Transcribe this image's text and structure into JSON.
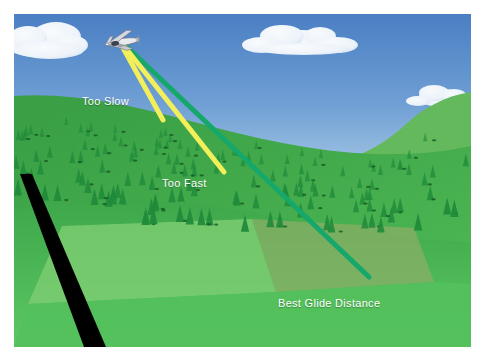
{
  "diagram": {
    "title": "Best Glide Distance",
    "frame": {
      "background_color": "#ffffff",
      "margin_px": 14,
      "scene_width": 457,
      "scene_height": 333
    },
    "sky": {
      "name": "sky",
      "color_top": "#4e82c4",
      "color_bottom": "#b9d4ea",
      "clouds": [
        {
          "name": "cloud-top-left",
          "x": 2,
          "y": 6,
          "w": 70,
          "h": 34
        },
        {
          "name": "cloud-upper-center",
          "x": 238,
          "y": 14,
          "w": 112,
          "h": 34
        },
        {
          "name": "cloud-right-small",
          "x": 398,
          "y": 72,
          "w": 56,
          "h": 20
        }
      ]
    },
    "terrain": {
      "name": "forested-hillside",
      "ridge_color": "#2f8f3e",
      "slope_color": "#3aa347",
      "meadow_color": "#52c15b",
      "field_light_color": "#7dcd73",
      "field_tan_color": "#8aa865",
      "far_hill_color": "#59b255",
      "tree_color": "#1f8a3a",
      "tree_count": 150
    },
    "road": {
      "name": "runway-strip",
      "color": "#000000",
      "label": ""
    },
    "aircraft": {
      "name": "airplane",
      "x": 122,
      "y": 42,
      "body_color": "#e8e8ec",
      "wing_color": "#d0d2d8",
      "outline_color": "#5a5f6b"
    },
    "glide_paths": [
      {
        "id": "too-slow",
        "label": "Too Slow",
        "color": "#f2ef5a",
        "stroke_width": 5,
        "origin": {
          "x": 122,
          "y": 46
        },
        "end": {
          "x": 163,
          "y": 120
        },
        "meaning": "steepest descent, shortest distance"
      },
      {
        "id": "too-fast",
        "label": "Too Fast",
        "color": "#f2ef5a",
        "stroke_width": 5,
        "origin": {
          "x": 124,
          "y": 46
        },
        "end": {
          "x": 224,
          "y": 172
        },
        "meaning": "intermediate descent, moderate distance"
      },
      {
        "id": "best-glide-distance",
        "label": "Best Glide Distance",
        "color": "#16a86a",
        "stroke_width": 5,
        "origin": {
          "x": 126,
          "y": 46
        },
        "end": {
          "x": 369,
          "y": 277
        },
        "meaning": "shallowest descent, longest distance"
      }
    ],
    "labels": {
      "too_slow": "Too Slow",
      "too_fast": "Too Fast",
      "best_glide": "Best Glide Distance"
    }
  }
}
